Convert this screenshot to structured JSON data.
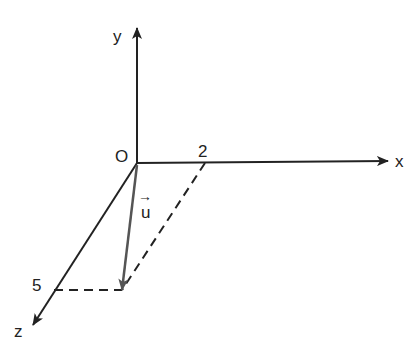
{
  "diagram": {
    "axes": {
      "x_label": "x",
      "y_label": "y",
      "z_label": "z",
      "origin_label": "O"
    },
    "ticks": {
      "x_value": "2",
      "z_value": "5"
    },
    "vector": {
      "name": "u",
      "arrow_glyph": "→",
      "components": {
        "x": 2,
        "y": 0,
        "z": 5
      }
    },
    "colors": {
      "axis": "#222222",
      "vector": "#555555",
      "dashed": "#222222"
    }
  }
}
